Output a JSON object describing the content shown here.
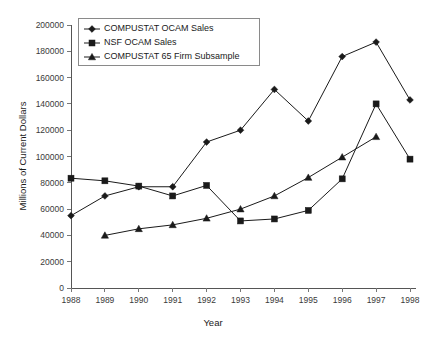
{
  "chart_data": {
    "type": "line",
    "title": "",
    "xlabel": "Year",
    "ylabel": "Millions of Current Dollars",
    "categories": [
      "1988",
      "1989",
      "1990",
      "1991",
      "1992",
      "1993",
      "1994",
      "1995",
      "1996",
      "1997",
      "1998"
    ],
    "x": [
      1988,
      1989,
      1990,
      1991,
      1992,
      1993,
      1994,
      1995,
      1996,
      1997,
      1998
    ],
    "xlim": [
      1988,
      1998
    ],
    "ylim": [
      0,
      200000
    ],
    "y_ticks": [
      0,
      20000,
      40000,
      60000,
      80000,
      100000,
      120000,
      140000,
      160000,
      180000,
      200000
    ],
    "y_tick_labels": [
      "0",
      "20000",
      "40000",
      "60000",
      "80000",
      "100000",
      "120000",
      "140000",
      "160000",
      "180000",
      "200000"
    ],
    "grid": false,
    "legend_position": "top-left",
    "series": [
      {
        "name": "COMPUSTAT OCAM Sales",
        "marker": "diamond",
        "color": "#1a1a1a",
        "values": [
          55000,
          70000,
          77000,
          77000,
          111000,
          120000,
          151000,
          127000,
          176000,
          187000,
          143000
        ]
      },
      {
        "name": "NSF OCAM Sales",
        "marker": "square",
        "color": "#1a1a1a",
        "values": [
          83500,
          81500,
          77500,
          70000,
          78000,
          51000,
          52500,
          59000,
          83000,
          140000,
          98000
        ]
      },
      {
        "name": "COMPUSTAT 65 Firm Subsample",
        "marker": "triangle",
        "color": "#1a1a1a",
        "values": [
          null,
          40000,
          45000,
          48000,
          53000,
          60000,
          70000,
          84000,
          99500,
          115000,
          null
        ]
      }
    ]
  }
}
